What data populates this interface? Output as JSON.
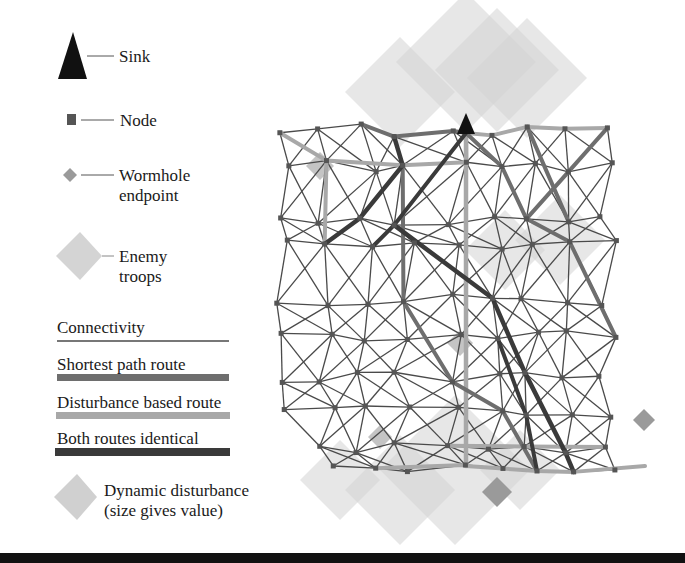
{
  "legend": {
    "sink": "Sink",
    "node": "Node",
    "wormhole_line1": "Wormhole",
    "wormhole_line2": "endpoint",
    "enemy_line1": "Enemy",
    "enemy_line2": "troops",
    "connectivity": "Connectivity",
    "shortest_path": "Shortest path route",
    "disturbance_route": "Disturbance based route",
    "both_identical": "Both routes identical",
    "dynamic_line1": "Dynamic disturbance",
    "dynamic_line2": "(size gives value)"
  },
  "colors": {
    "sink": "#111111",
    "node": "#555555",
    "connectivity": "#4a4a4a",
    "shortest_path": "#6e6e6e",
    "disturbance_route": "#a8a8a8",
    "both_identical": "#3a3a3a",
    "wormhole": "#9a9a9a",
    "enemy_troops": "#d4d4d4",
    "dynamic_disturbance": "#d0d0d0"
  },
  "network": {
    "sink_label": "Sink",
    "wormhole_count": 2
  }
}
